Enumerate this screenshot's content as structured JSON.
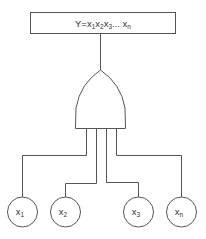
{
  "output": {
    "label_main": "Y=x",
    "terms": [
      {
        "base": "x",
        "sub": "1"
      },
      {
        "base": "x",
        "sub": "2"
      },
      {
        "base": "x",
        "sub": "3"
      }
    ],
    "ellipsis": "...",
    "last": {
      "base": "x",
      "sub": "n"
    }
  },
  "gate": {
    "type": "OR"
  },
  "inputs": [
    {
      "base": "x",
      "sub": "1"
    },
    {
      "base": "x",
      "sub": "2"
    },
    {
      "base": "x",
      "sub": "3"
    },
    {
      "base": "x",
      "sub": "n"
    }
  ]
}
